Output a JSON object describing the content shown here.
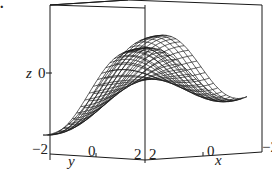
{
  "panel_label": ".",
  "chart_data": {
    "type": "surface",
    "title": "",
    "render": "wireframe mesh",
    "axes": {
      "z": {
        "label": "z",
        "ticks": [
          "0"
        ]
      },
      "y": {
        "label": "y",
        "ticks": [
          "-2",
          "0",
          "2"
        ],
        "range": [
          -2,
          2
        ]
      },
      "x": {
        "label": "x",
        "ticks": [
          "2",
          "0",
          "-2"
        ],
        "range": [
          -2,
          2
        ]
      }
    },
    "box": true
  },
  "labels": {
    "z_axis": "z",
    "z_tick": "0",
    "y_axis": "y",
    "y_ticks": [
      "−2",
      "0",
      "2"
    ],
    "x_axis": "x",
    "x_ticks": [
      "2",
      "0",
      "−2"
    ]
  },
  "colors": {
    "line": "#1a1a1a",
    "background": "#ffffff"
  }
}
